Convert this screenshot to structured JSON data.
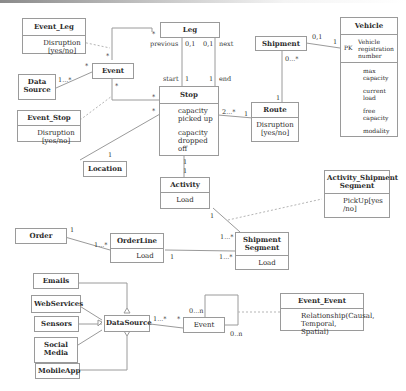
{
  "diagram": {
    "type": "UML class diagram",
    "classes": {
      "event_leg": {
        "name": "Event_Leg",
        "attributes": [
          "Disruption [yes/no]"
        ]
      },
      "leg": {
        "name": "Leg"
      },
      "shipment": {
        "name": "Shipment"
      },
      "vehicle": {
        "name": "Vehicle",
        "pk_label": "PK",
        "pk_attr": "Vehicle registration number",
        "attributes": [
          "max capacity",
          "current load",
          "free capacity",
          "modality"
        ]
      },
      "data_source_top": {
        "name": "Data Source"
      },
      "event_top": {
        "name": "Event"
      },
      "event_stop": {
        "name": "Event_Stop",
        "attributes": [
          "Disruption [yes/no]"
        ]
      },
      "stop": {
        "name": "Stop",
        "attributes": [
          "capacity picked up",
          "capacity dropped off"
        ]
      },
      "route": {
        "name": "Route",
        "attributes": [
          "Disruption [yes/no]"
        ]
      },
      "location": {
        "name": "Location"
      },
      "activity": {
        "name": "Activity",
        "attributes": [
          "Load"
        ]
      },
      "activity_shipment_segment": {
        "name": "Activity_Shipment Segment",
        "attributes": [
          "PickUp[yes /no]"
        ]
      },
      "order": {
        "name": "Order"
      },
      "order_line": {
        "name": "OrderLine",
        "attributes": [
          "Load"
        ]
      },
      "shipment_segment": {
        "name": "Shipment Segment",
        "attributes": [
          "Load"
        ]
      },
      "emails": {
        "name": "Emails"
      },
      "web_services": {
        "name": "WebServices"
      },
      "sensors": {
        "name": "Sensors"
      },
      "social_media": {
        "name": "Social Media"
      },
      "mobile_app": {
        "name": "MobileApp"
      },
      "data_source": {
        "name": "DataSource"
      },
      "event_bottom": {
        "name": "Event"
      },
      "event_event": {
        "name": "Event_Event",
        "attributes": [
          "Relationship(Causal, Temporal, Spatial)"
        ]
      }
    },
    "multiplicities": {
      "leg_prev_role": "previous",
      "leg_prev": "0,1",
      "leg_next": "0,1",
      "leg_next_role": "next",
      "stop_start_role": "start",
      "stop_start": "1",
      "stop_end": "1",
      "stop_end_role": "end",
      "event_leg_star1": "*",
      "event_leg_star2": "*",
      "ds_event_src": "1...*",
      "ds_event_star": "*",
      "event_stop_star1": "*",
      "event_stop_star2": "*",
      "event_stop_star3": "*",
      "location_1": "1",
      "stop_route_stop": "2...*",
      "stop_route_route": "1",
      "shipment_vehicle_ship": "0,1",
      "shipment_vehicle_veh": "1",
      "shipment_route_ship": "0...*",
      "shipment_route_route": "1",
      "stop_activity_a": "1",
      "stop_activity_b": "1",
      "activity_seg_1": "1",
      "activity_seg_many": "1...*",
      "order_1": "1",
      "order_line_many": "1...*",
      "orderline_seg_1": "1",
      "orderline_seg_many": "1...*",
      "ds_event_many": "1...*",
      "ds_event_star_b": "*",
      "event_loop_a": "0...n",
      "event_loop_b": "0..n"
    }
  }
}
